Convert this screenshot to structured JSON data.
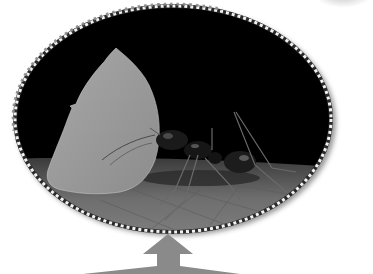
{
  "image": {
    "subject": "leaf-cutter ant carrying a leaf fragment",
    "style": "grayscale photo in oval frame",
    "frame": {
      "shape": "oval",
      "border": "dashed stitched white/gray",
      "shadow": true,
      "center": [
        173,
        119
      ],
      "radii": [
        159,
        114
      ]
    },
    "pointer": {
      "type": "up-arrow",
      "color": "#8a8a8a"
    },
    "colors": {
      "background": "#000000",
      "leaf": "#9a9a9a",
      "ground": "#7c7c7c",
      "border_dash": "#ffffff",
      "border_dot": "#888888",
      "arrow": "#8a8a8a"
    }
  }
}
